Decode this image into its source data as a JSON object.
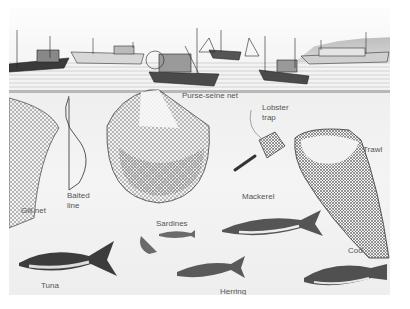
{
  "illustration": {
    "subject": "Commercial fishing methods and catch species",
    "gear_labels": {
      "purse_seine": "Purse-seine net",
      "lobster_trap_1": "Lobster",
      "lobster_trap_2": "trap",
      "trawl": "Trawl",
      "gill_net": "Gill net",
      "baited_line_1": "Baited",
      "baited_line_2": "line"
    },
    "fish_labels": {
      "mackerel": "Mackerel",
      "sardines": "Sardines",
      "cod": "Cod",
      "tuna": "Tuna",
      "herring": "Herring"
    },
    "colors": {
      "ink": "#2a2a2a",
      "label": "#555555",
      "water": "#efefef",
      "net": "#7a7a7a"
    }
  }
}
